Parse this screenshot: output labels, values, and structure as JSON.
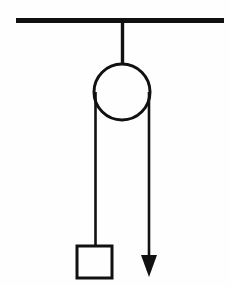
{
  "figure": {
    "background_color": "#ffffff",
    "ink_color": "#111111",
    "width": 230,
    "height": 286
  },
  "elements": {
    "ceiling": {
      "label": "ceiling-support-bar",
      "x1": 16,
      "y1": 20.5,
      "x2": 224,
      "y2": 20.5,
      "thickness": 5
    },
    "hanger_rod": {
      "label": "pulley-hanger-rod",
      "x1": 122.5,
      "y1": 21,
      "x2": 122.5,
      "y2": 65,
      "thickness": 3.4
    },
    "pulley": {
      "label": "pulley-wheel",
      "cx": 122,
      "cy": 92,
      "r": 28,
      "thickness": 3
    },
    "rope_left": {
      "label": "rope-left-segment",
      "x1": 95.5,
      "y1": 92,
      "x2": 95.5,
      "y2": 247,
      "thickness": 2.6
    },
    "rope_right": {
      "label": "rope-right-segment",
      "x1": 149,
      "y1": 92,
      "x2": 149,
      "y2": 262,
      "thickness": 2.6
    },
    "arrowhead": {
      "label": "force-direction-arrowhead",
      "tip_x": 149,
      "tip_y": 277,
      "left_x": 141,
      "left_y": 255,
      "right_x": 157,
      "right_y": 255,
      "direction": "down"
    },
    "block": {
      "label": "suspended-block",
      "x": 77,
      "y": 246,
      "width": 35,
      "height": 32,
      "thickness": 3
    }
  }
}
